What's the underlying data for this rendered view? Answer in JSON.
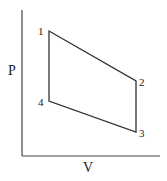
{
  "diagram": {
    "type": "pv-cycle",
    "axes": {
      "x_label": "V",
      "y_label": "P",
      "origin": [
        22,
        156
      ],
      "x_end": [
        160,
        156
      ],
      "y_end": [
        22,
        10
      ]
    },
    "points": [
      {
        "label": "1",
        "x": 49,
        "y": 31,
        "label_x": 38,
        "label_y": 35
      },
      {
        "label": "2",
        "x": 136,
        "y": 81,
        "label_x": 139,
        "label_y": 86
      },
      {
        "label": "3",
        "x": 136,
        "y": 132,
        "label_x": 139,
        "label_y": 137
      },
      {
        "label": "4",
        "x": 49,
        "y": 101,
        "label_x": 38,
        "label_y": 106
      }
    ],
    "path_order": [
      "1",
      "2",
      "3",
      "4",
      "1"
    ],
    "colors": {
      "line": "#333333",
      "text": "#222222",
      "background": "#ffffff"
    }
  }
}
